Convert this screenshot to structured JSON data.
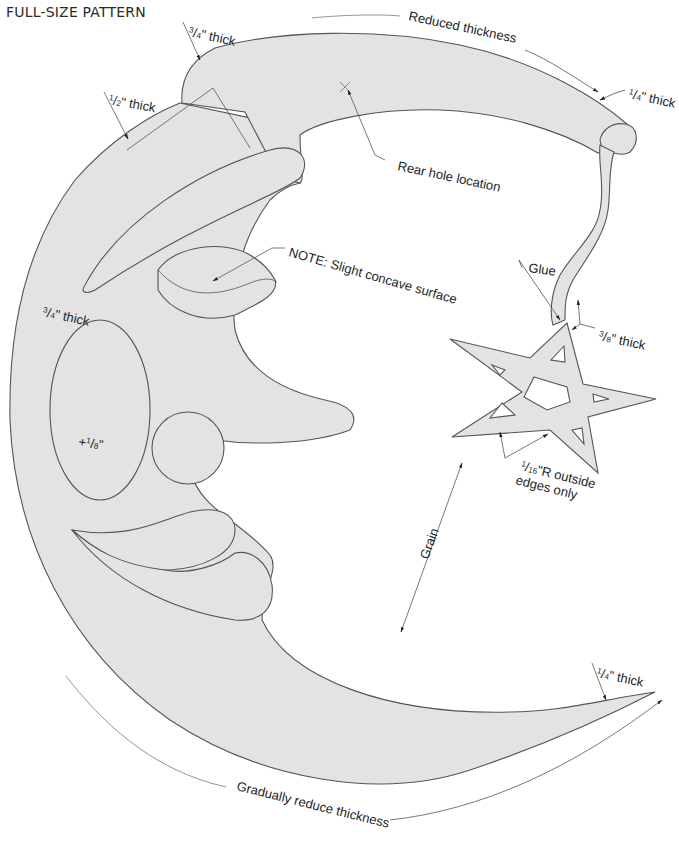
{
  "title": "FULL-SIZE PATTERN",
  "labels": {
    "hat_top_thickness": {
      "num": "3",
      "den": "4",
      "text": "\" thick"
    },
    "hat_brim_thickness": {
      "num": "1",
      "den": "2",
      "text": "\" thick"
    },
    "reduced_thickness": "Reduced thickness",
    "hat_tip_thickness": {
      "num": "1",
      "den": "4",
      "text": "\" thick"
    },
    "rear_hole": "Rear hole location",
    "note": "NOTE: Slight concave surface",
    "moon_thickness": {
      "num": "3",
      "den": "4",
      "text": "\" thick"
    },
    "cheek_offset": {
      "prefix": "+",
      "num": "1",
      "den": "8",
      "text": "\""
    },
    "glue": "Glue",
    "tassel_thickness": {
      "num": "3",
      "den": "8",
      "text": "\" thick"
    },
    "star_radius_line1": {
      "num": "1",
      "den": "16",
      "text": "\"R outside"
    },
    "star_radius_line2": "edges only",
    "grain": "Grain",
    "chin_tip_thickness": {
      "num": "1",
      "den": "4",
      "text": "\" thick"
    },
    "gradually_reduce": "Gradually reduce thickness"
  },
  "colors": {
    "fill": "#e3e3e3",
    "outline": "#555555",
    "text": "#1e1e1e"
  }
}
